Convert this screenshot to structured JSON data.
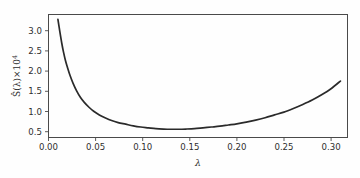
{
  "figure": {
    "background_color": "#fefefe",
    "frame_color": "#4a4a4a",
    "curve_color": "#2a2a2a"
  },
  "chart_data": {
    "type": "line",
    "title": "",
    "subtitle": "",
    "xlabel": "λ",
    "ylabel": "Ŝ(λ)×10⁴",
    "ylabel_parts": {
      "base": "Ŝ(λ)×10",
      "exponent": "4"
    },
    "xlim": [
      0.0,
      0.3175
    ],
    "ylim": [
      0.37,
      3.42
    ],
    "xticks": [
      0.0,
      0.05,
      0.1,
      0.15,
      0.2,
      0.25,
      0.3
    ],
    "xtick_labels": [
      "0.00",
      "0.05",
      "0.10",
      "0.15",
      "0.20",
      "0.25",
      "0.30"
    ],
    "yticks": [
      0.5,
      1.0,
      1.5,
      2.0,
      2.5,
      3.0
    ],
    "ytick_labels": [
      "0.5",
      "1.0",
      "1.5",
      "2.0",
      "2.5",
      "3.0"
    ],
    "grid": false,
    "legend": null,
    "legend_position": "none",
    "annotations": [],
    "series": [
      {
        "name": "S-hat",
        "x": [
          0.01,
          0.012,
          0.014,
          0.016,
          0.018,
          0.02,
          0.023,
          0.026,
          0.03,
          0.034,
          0.038,
          0.043,
          0.048,
          0.054,
          0.06,
          0.067,
          0.074,
          0.082,
          0.09,
          0.098,
          0.106,
          0.114,
          0.122,
          0.13,
          0.138,
          0.146,
          0.155,
          0.164,
          0.173,
          0.182,
          0.191,
          0.2,
          0.21,
          0.22,
          0.23,
          0.24,
          0.25,
          0.26,
          0.27,
          0.28,
          0.29,
          0.3,
          0.31
        ],
        "y": [
          3.3,
          3.0,
          2.72,
          2.48,
          2.28,
          2.12,
          1.9,
          1.72,
          1.52,
          1.36,
          1.24,
          1.12,
          1.02,
          0.93,
          0.86,
          0.79,
          0.74,
          0.7,
          0.66,
          0.63,
          0.61,
          0.59,
          0.58,
          0.575,
          0.575,
          0.58,
          0.59,
          0.61,
          0.63,
          0.65,
          0.68,
          0.71,
          0.75,
          0.8,
          0.86,
          0.93,
          1.0,
          1.09,
          1.19,
          1.3,
          1.43,
          1.58,
          1.77
        ],
        "minimum": {
          "x": 0.126,
          "y": 0.573
        }
      }
    ]
  }
}
